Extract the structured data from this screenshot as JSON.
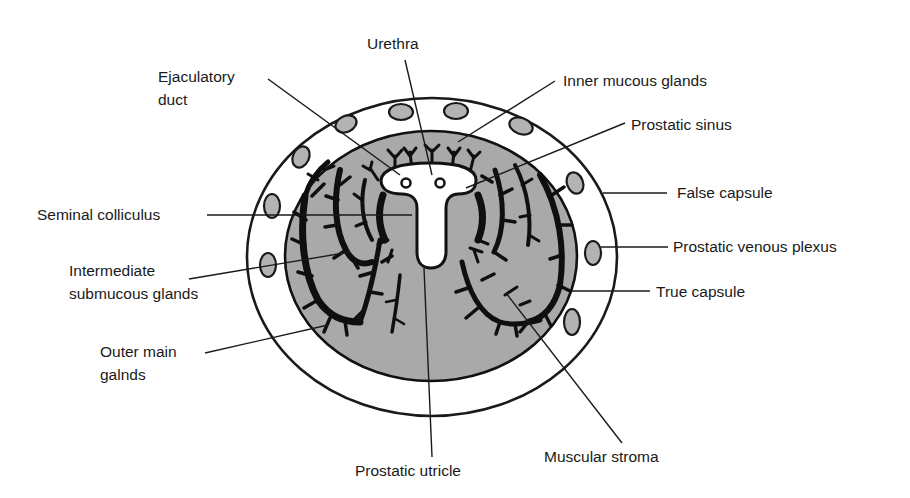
{
  "figure": {
    "colors": {
      "background": "#ffffff",
      "gland_fill": "#a9a9a9",
      "vein_fill": "#b3b3b3",
      "ducts": "#0f0f0f",
      "outline": "#1a1a1a"
    }
  },
  "labels": {
    "urethra": "Urethra",
    "ejaculatory_duct_1": "Ejaculatory",
    "ejaculatory_duct_2": "duct",
    "inner_mucous_glands": "Inner mucous glands",
    "prostatic_sinus": "Prostatic sinus",
    "false_capsule": "False capsule",
    "seminal_colliculus": "Seminal colliculus",
    "prostatic_venous_plexus": "Prostatic venous plexus",
    "intermediate_1": "Intermediate",
    "intermediate_2": "submucous glands",
    "true_capsule": "True capsule",
    "outer_main_1": "Outer main",
    "outer_main_2": "galnds",
    "prostatic_utricle": "Prostatic utricle",
    "muscular_stroma": "Muscular stroma"
  }
}
